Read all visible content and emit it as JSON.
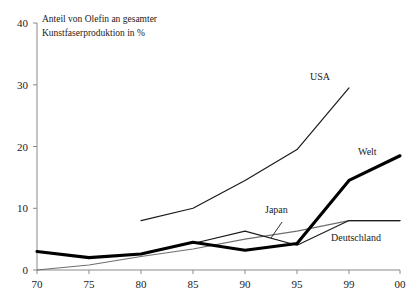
{
  "chart_data": {
    "type": "line",
    "title": "Anteil von Olefin an gesamter Kunstfaserproduktion in %",
    "title_line1": "Anteil von Olefin an gesamter",
    "title_line2": "Kunstfaserproduktion in %",
    "xlabel": "",
    "ylabel": "",
    "ylim": [
      0,
      40
    ],
    "yticks": [
      "0",
      "10",
      "20",
      "30",
      "40"
    ],
    "ytick_values": [
      0,
      10,
      20,
      30,
      40
    ],
    "xticks": [
      "70",
      "75",
      "80",
      "85",
      "90",
      "95",
      "99",
      "00"
    ],
    "xtick_values": [
      70,
      75,
      80,
      85,
      90,
      95,
      99,
      100
    ],
    "grid": false,
    "legend_position": "inline-annotations",
    "series": [
      {
        "name": "USA",
        "label": "USA",
        "style": "thin",
        "color": "#1a1a1a",
        "x": [
          80,
          85,
          90,
          95,
          99
        ],
        "values": [
          8.0,
          10.0,
          14.5,
          19.5,
          29.5
        ]
      },
      {
        "name": "Welt",
        "label": "Welt",
        "style": "bold",
        "color": "#000000",
        "x": [
          70,
          75,
          80,
          85,
          90,
          95,
          99,
          100
        ],
        "values": [
          3.0,
          2.0,
          2.6,
          4.5,
          3.2,
          4.3,
          14.5,
          18.5
        ]
      },
      {
        "name": "Japan",
        "label": "Japan",
        "style": "thin",
        "color": "#1a1a1a",
        "x": [
          85,
          90,
          95,
          99,
          100
        ],
        "values": [
          4.3,
          6.3,
          4.0,
          8.0,
          8.0
        ]
      },
      {
        "name": "Deutschland",
        "label": "Deutschland",
        "style": "thin-gray",
        "color": "#6e6e6e",
        "x": [
          70,
          75,
          80,
          85,
          90,
          95,
          99,
          100
        ],
        "values": [
          0.0,
          0.8,
          2.2,
          3.4,
          5.0,
          6.3,
          8.0,
          8.0
        ]
      }
    ],
    "annotations": [
      {
        "text": "USA",
        "series": "USA"
      },
      {
        "text": "Welt",
        "series": "Welt"
      },
      {
        "text": "Japan",
        "series": "Japan"
      },
      {
        "text": "Deutschland",
        "series": "Deutschland"
      }
    ]
  }
}
